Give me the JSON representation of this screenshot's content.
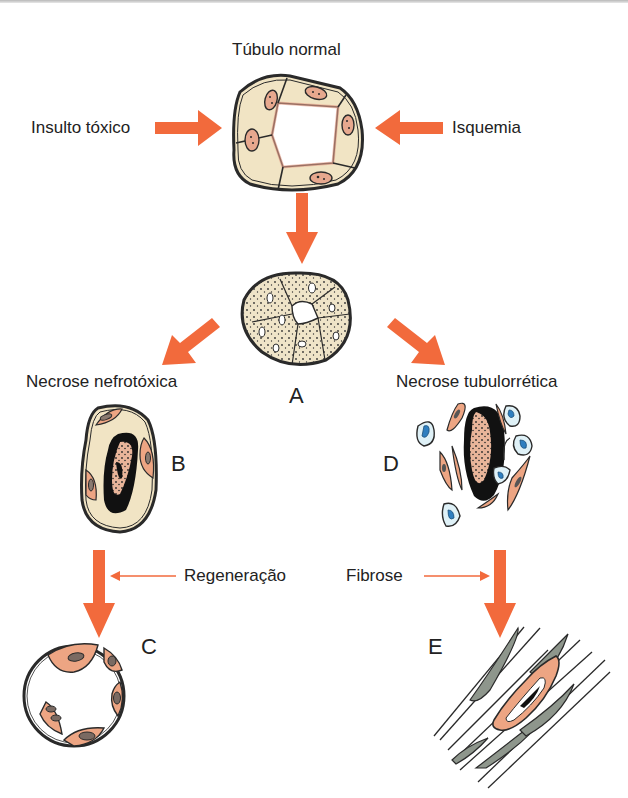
{
  "diagram": {
    "type": "flow",
    "colors": {
      "arrow": "#f26a3c",
      "cell_cytoplasm": "#f1e4c4",
      "cell_pink": "#eda583",
      "outline": "#2a2a2a",
      "blue_cell": "#dff1f7",
      "blue_nucleus": "#2f7fc0",
      "fibrosis": "#8e968c"
    },
    "labels": {
      "normal_tubule": "Túbulo normal",
      "toxic_insult": "Insulto tóxico",
      "ischemia": "Isquemia",
      "nephrotoxic_necrosis": "Necrose nefrotóxica",
      "tubulorrhexic_necrosis": "Necrose tubulorrética",
      "regeneration": "Regeneração",
      "fibrosis": "Fibrose"
    },
    "letters": {
      "a": "A",
      "b": "B",
      "c": "C",
      "d": "D",
      "e": "E"
    },
    "nodes": [
      {
        "id": "normal",
        "label": "Túbulo normal"
      },
      {
        "id": "A",
        "label": "A"
      },
      {
        "id": "B",
        "label": "B"
      },
      {
        "id": "C",
        "label": "C"
      },
      {
        "id": "D",
        "label": "D"
      },
      {
        "id": "E",
        "label": "E"
      }
    ],
    "edges": [
      {
        "from": "Insulto tóxico",
        "to": "normal"
      },
      {
        "from": "Isquemia",
        "to": "normal"
      },
      {
        "from": "normal",
        "to": "A"
      },
      {
        "from": "A",
        "to": "B",
        "label": "Necrose nefrotóxica"
      },
      {
        "from": "A",
        "to": "D",
        "label": "Necrose tubulorrética"
      },
      {
        "from": "B",
        "to": "C",
        "label": "Regeneração"
      },
      {
        "from": "D",
        "to": "E",
        "label": "Fibrose"
      }
    ]
  }
}
